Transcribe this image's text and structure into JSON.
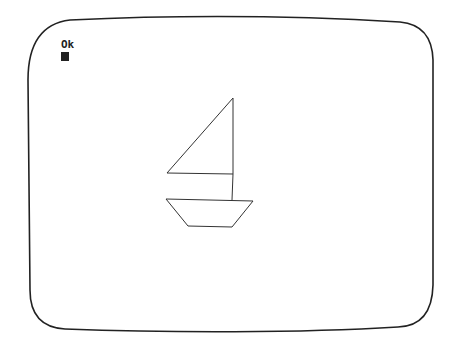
{
  "screen": {
    "prompt_text": "Ok",
    "cursor": "block-cursor",
    "drawing": {
      "subject": "sailboat",
      "line_color": "#222222",
      "sail": [
        [
          233,
          98
        ],
        [
          167,
          173
        ],
        [
          233,
          174
        ]
      ],
      "mast": [
        [
          233,
          98
        ],
        [
          232,
          200
        ]
      ],
      "hull": [
        [
          166,
          199
        ],
        [
          253,
          201
        ],
        [
          232,
          227
        ],
        [
          188,
          226
        ]
      ]
    }
  }
}
